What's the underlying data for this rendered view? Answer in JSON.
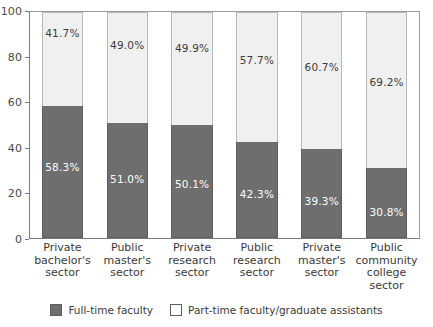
{
  "chart_data": {
    "type": "bar",
    "subtype": "stacked-100-percent",
    "title": "",
    "xlabel": "",
    "ylabel": "",
    "ylim": [
      0,
      100
    ],
    "yticks": [
      100,
      80,
      60,
      40,
      20,
      0
    ],
    "grid": false,
    "legend_position": "bottom-center",
    "categories": [
      "Private bachelor's sector",
      "Public master's sector",
      "Private research sector",
      "Public research sector",
      "Private master's sector",
      "Public community college sector"
    ],
    "category_lines": [
      [
        "Private",
        "bachelor's",
        "sector"
      ],
      [
        "Public",
        "master's",
        "sector"
      ],
      [
        "Private",
        "research",
        "sector"
      ],
      [
        "Public",
        "research",
        "sector"
      ],
      [
        "Private",
        "master's",
        "sector"
      ],
      [
        "Public",
        "community",
        "college",
        "sector"
      ]
    ],
    "series": [
      {
        "name": "Full-time faculty",
        "color": "#6e6e6e",
        "values": [
          58.3,
          51.0,
          50.1,
          42.3,
          39.3,
          30.8
        ],
        "labels": [
          "58.3%",
          "51.0%",
          "50.1%",
          "42.3%",
          "39.3%",
          "30.8%"
        ]
      },
      {
        "name": "Part-time faculty/graduate assistants",
        "color": "#f0f0f0",
        "values": [
          41.7,
          49.0,
          49.9,
          57.7,
          60.7,
          69.2
        ],
        "labels": [
          "41.7%",
          "49.0%",
          "49.9%",
          "57.7%",
          "60.7%",
          "69.2%"
        ]
      }
    ]
  },
  "axis": {
    "y_tick_labels": [
      "100",
      "80",
      "60",
      "40",
      "20",
      "0"
    ]
  },
  "legend": {
    "items": [
      {
        "label": "Full-time faculty",
        "swatch": "dark-gray-swatch"
      },
      {
        "label": "Part-time faculty/graduate assistants",
        "swatch": "white-swatch"
      }
    ]
  }
}
